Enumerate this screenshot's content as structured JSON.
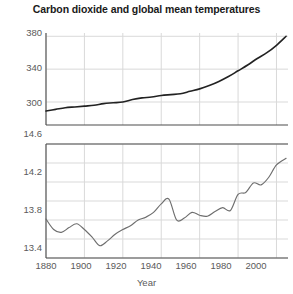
{
  "chart_data": {
    "type": "line",
    "title": "Carbon dioxide and global mean temperatures",
    "xlabel": "Year",
    "grid": true,
    "legend": "none",
    "panels": [
      {
        "name": "carbon-dioxide",
        "ylabel": "",
        "ylim": [
          272,
          384
        ],
        "yticks": [
          300,
          340,
          380
        ],
        "ytick_labels": [
          "300",
          "340",
          "380"
        ],
        "xlim": [
          1880,
          2006
        ],
        "series": [
          {
            "name": "Atmospheric CO2 (ppm)",
            "color": "#222222",
            "x": [
              1880,
              1885,
              1890,
              1895,
              1900,
              1905,
              1910,
              1915,
              1920,
              1925,
              1930,
              1935,
              1940,
              1945,
              1950,
              1955,
              1960,
              1965,
              1970,
              1975,
              1980,
              1985,
              1990,
              1995,
              2000,
              2005
            ],
            "values": [
              289,
              291,
              293,
              294,
              295,
              296,
              298,
              299,
              300,
              303,
              305,
              306,
              308,
              309,
              310,
              313,
              316,
              320,
              325,
              331,
              338,
              345,
              353,
              360,
              369,
              380
            ]
          }
        ]
      },
      {
        "name": "global-mean-temperature",
        "ylabel": "",
        "ylim": [
          13.4,
          14.6
        ],
        "yticks": [
          13.4,
          13.8,
          14.2,
          14.6
        ],
        "ytick_labels": [
          "13.4",
          "13.8",
          "14.2",
          "14.6"
        ],
        "yminor": [
          13.6,
          14.0,
          14.4
        ],
        "xlim": [
          1880,
          2006
        ],
        "series": [
          {
            "name": "Global mean temperature (°C)",
            "color": "#6e6e6e",
            "x": [
              1880,
              1884,
              1888,
              1892,
              1896,
              1900,
              1904,
              1908,
              1912,
              1916,
              1920,
              1924,
              1928,
              1932,
              1936,
              1940,
              1944,
              1948,
              1952,
              1956,
              1960,
              1964,
              1968,
              1972,
              1976,
              1980,
              1984,
              1988,
              1992,
              1996,
              2000,
              2005
            ],
            "values": [
              13.81,
              13.7,
              13.67,
              13.72,
              13.76,
              13.7,
              13.62,
              13.53,
              13.58,
              13.65,
              13.7,
              13.74,
              13.8,
              13.83,
              13.88,
              13.97,
              14.02,
              13.8,
              13.82,
              13.88,
              13.85,
              13.84,
              13.89,
              13.93,
              13.9,
              14.07,
              14.09,
              14.19,
              14.17,
              14.25,
              14.38,
              14.45
            ]
          }
        ]
      }
    ],
    "xticks": [
      1880,
      1900,
      1920,
      1940,
      1960,
      1980,
      2000
    ],
    "xtick_labels": [
      "1880",
      "1900",
      "1920",
      "1940",
      "1960",
      "1980",
      "2000"
    ]
  },
  "colors": {
    "background": "#ffffff",
    "axis": "#4d4d4d",
    "grid": "#d9d9d9",
    "tick_text": "#5a5a5a",
    "title_text": "#1a1a1a",
    "co2_line": "#222222",
    "temp_line": "#6e6e6e"
  }
}
